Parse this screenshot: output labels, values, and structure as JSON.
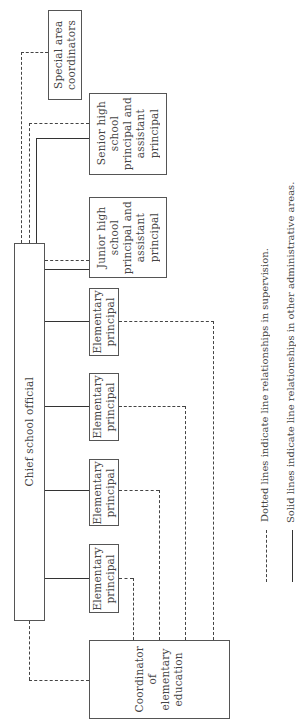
{
  "chart": {
    "orientation": "rotated 90deg counter-clockwise",
    "nodes": {
      "chief": {
        "label": "Chief school official"
      },
      "special": {
        "label": "Special area\ncoordinators"
      },
      "senior": {
        "label": "Senior high\nschool\nprincipal and\nassistant\nprincipal"
      },
      "junior": {
        "label": "Junior high\nschool\nprincipal and\nassistant\nprincipal"
      },
      "elem1": {
        "label": "Elementary\nprincipal"
      },
      "elem2": {
        "label": "Elementary\nprincipal"
      },
      "elem3": {
        "label": "Elementary\nprincipal"
      },
      "elem4": {
        "label": "Elementary\nprincipal"
      },
      "coordinator": {
        "label": "Coordinator\nof\nelementary\neducation"
      }
    },
    "edges": [
      {
        "from": "chief",
        "to": "special",
        "style": "dashed"
      },
      {
        "from": "chief",
        "to": "senior",
        "style": "dashed"
      },
      {
        "from": "chief",
        "to": "senior",
        "style": "solid"
      },
      {
        "from": "chief",
        "to": "junior",
        "style": "dashed"
      },
      {
        "from": "chief",
        "to": "junior",
        "style": "solid"
      },
      {
        "from": "chief",
        "to": "elem1",
        "style": "solid"
      },
      {
        "from": "chief",
        "to": "elem2",
        "style": "solid"
      },
      {
        "from": "chief",
        "to": "elem3",
        "style": "solid"
      },
      {
        "from": "chief",
        "to": "elem4",
        "style": "solid"
      },
      {
        "from": "chief",
        "to": "coordinator",
        "style": "dashed"
      },
      {
        "from": "coordinator",
        "to": "elem1",
        "style": "dashed"
      },
      {
        "from": "coordinator",
        "to": "elem2",
        "style": "dashed"
      },
      {
        "from": "coordinator",
        "to": "elem3",
        "style": "dashed"
      },
      {
        "from": "coordinator",
        "to": "elem4",
        "style": "dashed"
      }
    ]
  },
  "legend": {
    "dashed": "Dotted lines indicate line relationships in supervision.",
    "solid": "Solid lines indicate line relationships in other administrative areas."
  }
}
